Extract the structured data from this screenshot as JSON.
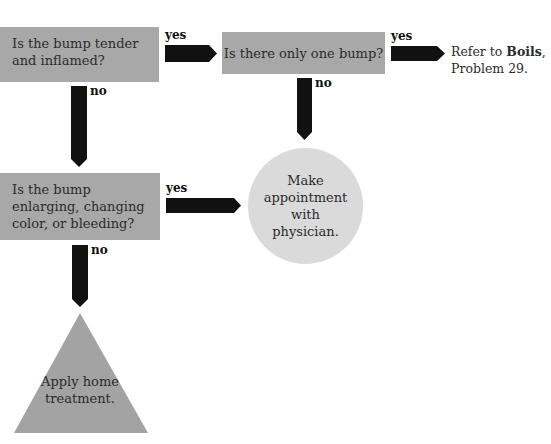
{
  "flowchart": {
    "questions": [
      {
        "id": "q1",
        "text": "Is the bump tender and inflamed?"
      },
      {
        "id": "q2",
        "text": "Is there only one bump?"
      },
      {
        "id": "q3",
        "text": "Is the bump enlarging, changing color, or bleeding?"
      }
    ],
    "branch_labels": {
      "q1_yes": "yes",
      "q1_no": "no",
      "q2_yes": "yes",
      "q2_no": "no",
      "q3_yes": "yes",
      "q3_no": "no"
    },
    "outcomes": {
      "refer": {
        "prefix": "Refer to ",
        "bold": "Boils",
        "suffix": ",",
        "line2": "Problem 29."
      },
      "appointment": "Make appointment with physician.",
      "home": "Apply home treatment."
    },
    "colors": {
      "question_fill": "#a8a8a8",
      "appointment_fill": "#dadada",
      "home_fill": "#a3a3a3",
      "arrow": "#111111"
    }
  }
}
